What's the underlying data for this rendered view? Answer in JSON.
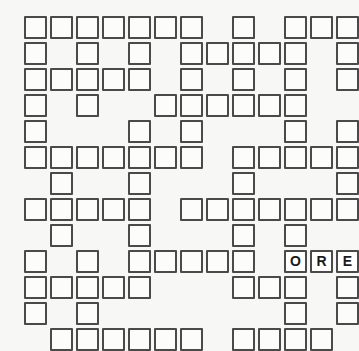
{
  "puzzle": {
    "name": "crossword-grid",
    "type": "crossword",
    "columns": 13,
    "rows": 13,
    "cell_size_px": 23,
    "cell_pitch_px": 26,
    "origin_x_px": 24,
    "origin_y_px": 16,
    "colors": {
      "background": "#f7f7f5",
      "cell_fill": "#fcfcfa",
      "cell_border": "#4a4a4a",
      "letter_color": "#1a1a1a"
    },
    "grid": [
      [
        1,
        1,
        1,
        1,
        1,
        1,
        1,
        0,
        1,
        0,
        1,
        1,
        1
      ],
      [
        1,
        0,
        1,
        0,
        1,
        0,
        1,
        1,
        1,
        1,
        1,
        0,
        1
      ],
      [
        1,
        1,
        1,
        1,
        1,
        0,
        1,
        0,
        1,
        0,
        1,
        0,
        1
      ],
      [
        1,
        0,
        1,
        0,
        0,
        1,
        1,
        1,
        1,
        1,
        1,
        0,
        0
      ],
      [
        1,
        0,
        0,
        0,
        1,
        0,
        1,
        0,
        0,
        0,
        1,
        0,
        1
      ],
      [
        1,
        1,
        1,
        1,
        1,
        1,
        1,
        0,
        1,
        1,
        1,
        1,
        1
      ],
      [
        0,
        1,
        0,
        0,
        1,
        0,
        0,
        0,
        1,
        0,
        0,
        0,
        1
      ],
      [
        1,
        1,
        1,
        1,
        1,
        0,
        1,
        1,
        1,
        1,
        1,
        1,
        1
      ],
      [
        0,
        1,
        0,
        0,
        1,
        0,
        0,
        0,
        1,
        0,
        1,
        0,
        0
      ],
      [
        1,
        0,
        1,
        0,
        1,
        1,
        1,
        1,
        1,
        0,
        1,
        1,
        1
      ],
      [
        1,
        1,
        1,
        1,
        1,
        0,
        0,
        0,
        1,
        1,
        1,
        0,
        1
      ],
      [
        1,
        0,
        1,
        0,
        0,
        0,
        0,
        0,
        0,
        0,
        1,
        0,
        1
      ],
      [
        0,
        1,
        1,
        1,
        1,
        1,
        1,
        0,
        1,
        1,
        1,
        1,
        0
      ]
    ],
    "letters": [
      {
        "row": 9,
        "col": 10,
        "letter": "O"
      },
      {
        "row": 9,
        "col": 11,
        "letter": "R"
      },
      {
        "row": 9,
        "col": 12,
        "letter": "E"
      }
    ],
    "entered_word": "ORE"
  }
}
